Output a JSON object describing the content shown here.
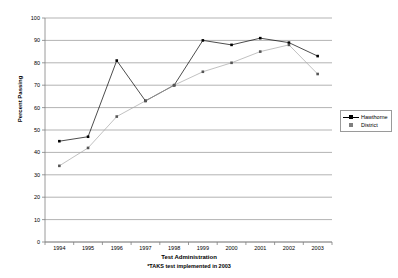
{
  "chart_data": {
    "type": "line",
    "title": "",
    "xlabel": "Test Administration",
    "ylabel": "Percent Passing",
    "note": "*TAKS test implemented in 2003",
    "categories": [
      "1994",
      "1995",
      "1996",
      "1997",
      "1998",
      "1999",
      "2000",
      "2001",
      "2002",
      "2003"
    ],
    "ylim": [
      0,
      100
    ],
    "ytick_step": 10,
    "yticks": [
      "0",
      "10",
      "20",
      "30",
      "40",
      "50",
      "60",
      "70",
      "80",
      "90",
      "100"
    ],
    "grid": "horizontal",
    "legend_position": "right",
    "series": [
      {
        "name": "Hawthorne",
        "color": "#000000",
        "marker": "square",
        "values": [
          45,
          47,
          81,
          63,
          70,
          90,
          88,
          91,
          89,
          83
        ]
      },
      {
        "name": "District",
        "color": "#a6a6a6",
        "marker": "square",
        "values": [
          34,
          42,
          56,
          63,
          70,
          76,
          80,
          85,
          88,
          75
        ]
      }
    ]
  },
  "legend": {
    "items": [
      {
        "label": "Hawthorne"
      },
      {
        "label": "District"
      }
    ]
  },
  "colors": {
    "series_hawthorne": "#000000",
    "series_district": "#a6a6a6",
    "grid": "#808080",
    "axis": "#808080",
    "background": "#ffffff"
  }
}
